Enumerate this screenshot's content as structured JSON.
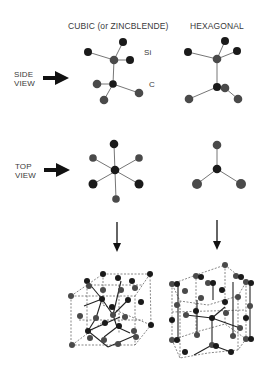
{
  "headers": {
    "cubic": "CUBIC (or ZINCBLENDE)",
    "hexagonal": "HEXAGONAL"
  },
  "row_labels": {
    "side_view": [
      "SIDE",
      "VIEW"
    ],
    "top_view": [
      "TOP",
      "VIEW"
    ]
  },
  "atom_labels": {
    "si": "Si",
    "c": "C"
  },
  "colors": {
    "si_atom": "#1a1a1a",
    "c_atom": "#4a4a4a",
    "bond": "#555555",
    "text": "#3a3a3a",
    "arrow": "#111111"
  }
}
